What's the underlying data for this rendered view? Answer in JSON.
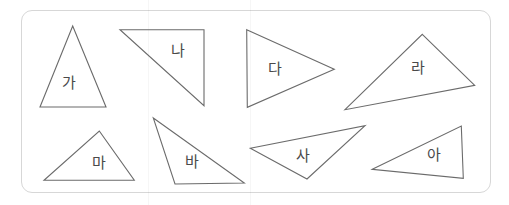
{
  "worksheet": {
    "title": "Triangle shapes worksheet",
    "frame": {
      "x": 21,
      "y": 10,
      "width": 470,
      "height": 183,
      "radius": 11,
      "border_color": "#d7d7d7",
      "background_color": "#ffffff"
    },
    "stroke_color": "#6b6b6b",
    "label_color": "#4a4a4a",
    "shapes": [
      {
        "id": "triangle-ga",
        "label": "가",
        "label_x": 69,
        "label_y": 83,
        "points": "72.7,26 40,107 106,107"
      },
      {
        "id": "triangle-na",
        "label": "나",
        "label_x": 178,
        "label_y": 51,
        "points": "120,29.7 204,29.7 204,105.7"
      },
      {
        "id": "triangle-da",
        "label": "다",
        "label_x": 275,
        "label_y": 69,
        "points": "246.7,29.7 334.3,69.3 247.3,107.3"
      },
      {
        "id": "triangle-ra",
        "label": "라",
        "label_x": 418,
        "label_y": 68,
        "points": "422.3,34.3 474.7,85.3 345,109.7"
      },
      {
        "id": "triangle-ma",
        "label": "마",
        "label_x": 99,
        "label_y": 163,
        "points": "99.3,131 134.3,180.3 44,180.3"
      },
      {
        "id": "triangle-ba",
        "label": "바",
        "label_x": 192,
        "label_y": 162,
        "points": "153.3,118 244.3,183 175,184"
      },
      {
        "id": "triangle-sa",
        "label": "사",
        "label_x": 303,
        "label_y": 156,
        "points": "250.3,148.3 365,125.7 307,179"
      },
      {
        "id": "triangle-a",
        "label": "아",
        "label_x": 434,
        "label_y": 155,
        "points": "372.3,169.3 461.3,126 463.3,178.3"
      }
    ]
  }
}
